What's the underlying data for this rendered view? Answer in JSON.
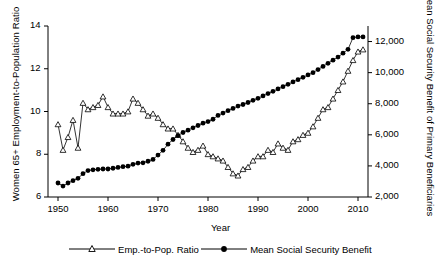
{
  "chart_data": {
    "type": "line",
    "title": "",
    "xlabel": "Year",
    "ylabel": "Women 65+ Employment-to-Population Ratio",
    "ylabel_right": "Mean Social Security Benefit of Primary Beneficiaries",
    "xlim": [
      1948,
      2012
    ],
    "ylim": [
      6,
      14
    ],
    "ylim_right": [
      2000,
      13000
    ],
    "grid": false,
    "legend_position": "bottom",
    "xticks": [
      1950,
      1960,
      1970,
      1980,
      1990,
      2000,
      2010
    ],
    "xtick_labels": [
      "1950",
      "1960",
      "1970",
      "1980",
      "1990",
      "2000",
      "2010"
    ],
    "yticks": [
      6,
      8,
      10,
      12,
      14
    ],
    "ytick_labels": [
      "6",
      "8",
      "10",
      "12",
      "14"
    ],
    "yticks_right": [
      2000,
      4000,
      6000,
      8000,
      10000,
      12000
    ],
    "ytick_labels_right": [
      "2,000",
      "4,000",
      "6,000",
      "8,000",
      "10,000",
      "12,000"
    ],
    "x": [
      1950,
      1951,
      1952,
      1953,
      1954,
      1955,
      1956,
      1957,
      1958,
      1959,
      1960,
      1961,
      1962,
      1963,
      1964,
      1965,
      1966,
      1967,
      1968,
      1969,
      1970,
      1971,
      1972,
      1973,
      1974,
      1975,
      1976,
      1977,
      1978,
      1979,
      1980,
      1981,
      1982,
      1983,
      1984,
      1985,
      1986,
      1987,
      1988,
      1989,
      1990,
      1991,
      1992,
      1993,
      1994,
      1995,
      1996,
      1997,
      1998,
      1999,
      2000,
      2001,
      2002,
      2003,
      2004,
      2005,
      2006,
      2007,
      2008,
      2009,
      2010,
      2011
    ],
    "series": [
      {
        "name": "Emp.-to-Pop. Ratio",
        "axis": "left",
        "marker": "open-triangle",
        "values": [
          9.4,
          8.2,
          8.8,
          9.6,
          8.3,
          10.4,
          10.1,
          10.2,
          10.3,
          10.7,
          10.2,
          9.9,
          9.9,
          9.9,
          10.0,
          10.6,
          10.4,
          10.1,
          9.8,
          9.9,
          9.7,
          9.4,
          9.2,
          9.2,
          8.9,
          8.6,
          8.3,
          8.1,
          8.2,
          8.4,
          8.0,
          7.9,
          7.8,
          7.7,
          7.4,
          7.1,
          7.0,
          7.3,
          7.4,
          7.7,
          7.9,
          7.9,
          8.2,
          8.1,
          8.5,
          8.3,
          8.2,
          8.6,
          8.7,
          8.9,
          9.0,
          9.3,
          9.7,
          10.1,
          10.2,
          10.6,
          11.0,
          11.4,
          11.9,
          12.4,
          12.8,
          12.9
        ]
      },
      {
        "name": "Mean Social Security Benefit",
        "axis": "right",
        "marker": "filled-circle",
        "values": [
          2900,
          2700,
          2900,
          3050,
          3200,
          3500,
          3700,
          3750,
          3780,
          3800,
          3800,
          3850,
          3900,
          3950,
          3980,
          4100,
          4180,
          4200,
          4300,
          4420,
          4700,
          5000,
          5400,
          5700,
          5950,
          6150,
          6300,
          6450,
          6600,
          6750,
          6850,
          7000,
          7250,
          7400,
          7550,
          7700,
          7850,
          7950,
          8080,
          8220,
          8350,
          8500,
          8650,
          8800,
          8950,
          9100,
          9250,
          9400,
          9550,
          9700,
          9850,
          10000,
          10200,
          10400,
          10600,
          10800,
          11000,
          11250,
          11500,
          12250,
          12300,
          12300
        ]
      }
    ]
  },
  "legend": {
    "items": [
      {
        "label": "Emp.-to-Pop. Ratio",
        "marker": "open-triangle"
      },
      {
        "label": "Mean Social Security Benefit",
        "marker": "filled-circle"
      }
    ]
  }
}
